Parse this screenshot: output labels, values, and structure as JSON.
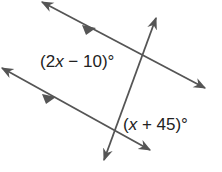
{
  "diagram": {
    "type": "parallel-lines-cut-by-transversal",
    "line_color": "#555555",
    "label_color": "#222222",
    "angles": [
      {
        "id": "angle-top",
        "expression": "(2x − 10)°",
        "prefix": "(2",
        "var": "x",
        "suffix": " − 10)°"
      },
      {
        "id": "angle-bottom",
        "expression": "(x + 45)°",
        "prefix": "(",
        "var": "x",
        "suffix": " + 45)°"
      }
    ],
    "lines": [
      {
        "id": "parallel-top",
        "x1": 42,
        "y1": 2,
        "x2": 205,
        "y2": 88,
        "parallel_marker": true
      },
      {
        "id": "parallel-bottom",
        "x1": 2,
        "y1": 68,
        "x2": 150,
        "y2": 150,
        "parallel_marker": true
      },
      {
        "id": "transversal",
        "x1": 156,
        "y1": 18,
        "x2": 104,
        "y2": 160,
        "parallel_marker": false
      }
    ]
  }
}
